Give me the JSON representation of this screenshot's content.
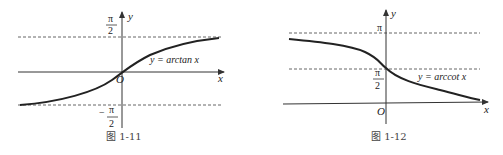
{
  "figures": [
    {
      "id": "fig-1-11",
      "caption": "图 1-11",
      "curve_label": "y = arctan x",
      "x_axis_label": "x",
      "y_axis_label": "y",
      "origin_label": "O",
      "upper_asymptote": {
        "num": "π",
        "den": "2"
      },
      "lower_asymptote": {
        "sign": "−",
        "num": "π",
        "den": "2"
      }
    },
    {
      "id": "fig-1-12",
      "caption": "图 1-12",
      "curve_label": "y = arccot x",
      "x_axis_label": "x",
      "y_axis_label": "y",
      "origin_label": "O",
      "upper_asymptote": {
        "label": "π"
      },
      "mid_value": {
        "num": "π",
        "den": "2"
      }
    }
  ],
  "colors": {
    "curve": "#222222",
    "axis": "#333333",
    "dashed": "#555555"
  }
}
